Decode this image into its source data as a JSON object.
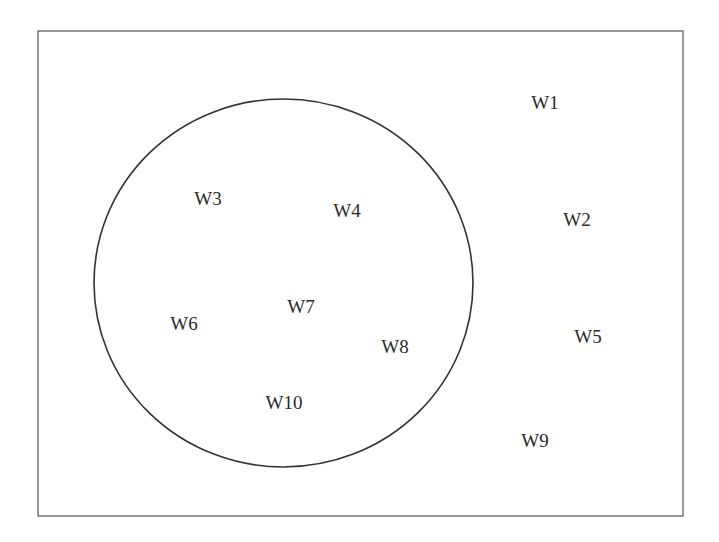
{
  "diagram": {
    "type": "venn",
    "frame": {
      "x": 38,
      "y": 31,
      "width": 645,
      "height": 485,
      "stroke": "#555555"
    },
    "circle": {
      "cx": 283.5,
      "cy": 283,
      "rx": 189.5,
      "ry": 184,
      "stroke": "#333333"
    },
    "labels": [
      {
        "text": "W1",
        "x": 545,
        "y": 102,
        "inside_circle": false
      },
      {
        "text": "W2",
        "x": 577,
        "y": 219,
        "inside_circle": false
      },
      {
        "text": "W3",
        "x": 208,
        "y": 198,
        "inside_circle": true
      },
      {
        "text": "W4",
        "x": 347,
        "y": 210,
        "inside_circle": true
      },
      {
        "text": "W5",
        "x": 588,
        "y": 336,
        "inside_circle": false
      },
      {
        "text": "W6",
        "x": 184,
        "y": 323,
        "inside_circle": true
      },
      {
        "text": "W7",
        "x": 301,
        "y": 306,
        "inside_circle": true
      },
      {
        "text": "W8",
        "x": 395,
        "y": 346,
        "inside_circle": true
      },
      {
        "text": "W9",
        "x": 535,
        "y": 440,
        "inside_circle": false
      },
      {
        "text": "W10",
        "x": 284,
        "y": 402,
        "inside_circle": true
      }
    ]
  }
}
